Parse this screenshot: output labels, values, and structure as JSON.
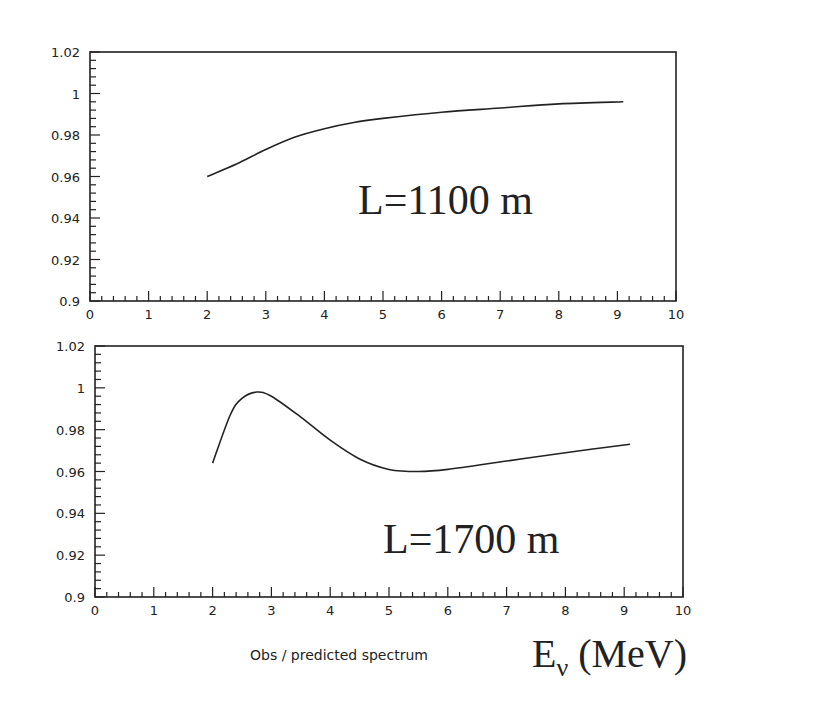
{
  "chart_data": [
    {
      "type": "line",
      "title": "",
      "annotation": "L=1100 m",
      "xlabel": "",
      "ylabel": "",
      "xlim": [
        0,
        10
      ],
      "ylim": [
        0.9,
        1.02
      ],
      "xticks": [
        "0",
        "1",
        "2",
        "3",
        "4",
        "5",
        "6",
        "7",
        "8",
        "9",
        "10"
      ],
      "yticks": [
        "0.9",
        "0.92",
        "0.94",
        "0.96",
        "0.98",
        "1",
        "1.02"
      ],
      "grid": false,
      "series": [
        {
          "name": "L=1100 m",
          "x": [
            2.0,
            2.5,
            3.0,
            3.5,
            4.0,
            4.5,
            5.0,
            6.0,
            7.0,
            8.0,
            9.1
          ],
          "y": [
            0.96,
            0.966,
            0.973,
            0.979,
            0.983,
            0.986,
            0.988,
            0.991,
            0.993,
            0.995,
            0.996
          ]
        }
      ]
    },
    {
      "type": "line",
      "title": "",
      "annotation": "L=1700 m",
      "xlabel": "E_ν (MeV)",
      "ylabel": "",
      "xlim": [
        0,
        10
      ],
      "ylim": [
        0.9,
        1.02
      ],
      "xticks": [
        "0",
        "1",
        "2",
        "3",
        "4",
        "5",
        "6",
        "7",
        "8",
        "9",
        "10"
      ],
      "yticks": [
        "0.9",
        "0.92",
        "0.94",
        "0.96",
        "0.98",
        "1",
        "1.02"
      ],
      "grid": false,
      "series": [
        {
          "name": "L=1700 m",
          "x": [
            2.0,
            2.3,
            2.5,
            2.75,
            3.0,
            3.5,
            4.0,
            4.5,
            5.0,
            5.5,
            6.0,
            7.0,
            8.0,
            9.1
          ],
          "y": [
            0.964,
            0.987,
            0.995,
            0.998,
            0.996,
            0.986,
            0.975,
            0.966,
            0.961,
            0.96,
            0.961,
            0.965,
            0.969,
            0.973
          ]
        }
      ]
    }
  ],
  "labels": {
    "top_annotation": "L=1100 m",
    "bottom_annotation": "L=1700 m",
    "caption": "Obs / predicted spectrum",
    "x_unit_main": "E",
    "x_unit_sub": "ν",
    "x_unit_rest": " (MeV)"
  },
  "colors": {
    "line": "#222222",
    "background": "#ffffff"
  }
}
